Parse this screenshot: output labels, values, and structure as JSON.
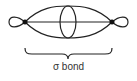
{
  "diagram": {
    "type": "orbital-overlap",
    "label": "σ bond",
    "elements": {
      "left_nucleus": "filled dot",
      "right_nucleus": "filled dot",
      "left_back_lobe": "small orbital lobe",
      "right_back_lobe": "small orbital lobe",
      "bonding_region": "large overlapping ellipse",
      "nodal_plane_cross_section": "vertical ellipse at center",
      "internuclear_axis": "horizontal line",
      "brace": "curly brace under bonding region"
    },
    "colors": {
      "stroke": "#222222",
      "text": "#333333",
      "background": "#ffffff"
    }
  }
}
